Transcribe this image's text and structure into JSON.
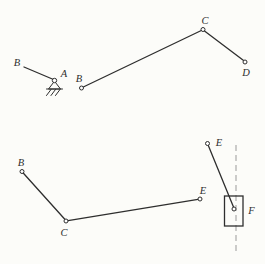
{
  "theme": {
    "background": "#fcfcf9",
    "ink": "#2e2e2e",
    "guide": "#9a9a9a"
  },
  "figures": {
    "top_left": {
      "labels": {
        "B": "B",
        "A": "A"
      }
    },
    "top_right": {
      "labels": {
        "B": "B",
        "C": "C",
        "D": "D"
      }
    },
    "bottom_left": {
      "labels": {
        "B": "B",
        "C": "C",
        "E": "E"
      }
    },
    "bottom_right": {
      "labels": {
        "E": "E",
        "F": "F"
      }
    }
  }
}
